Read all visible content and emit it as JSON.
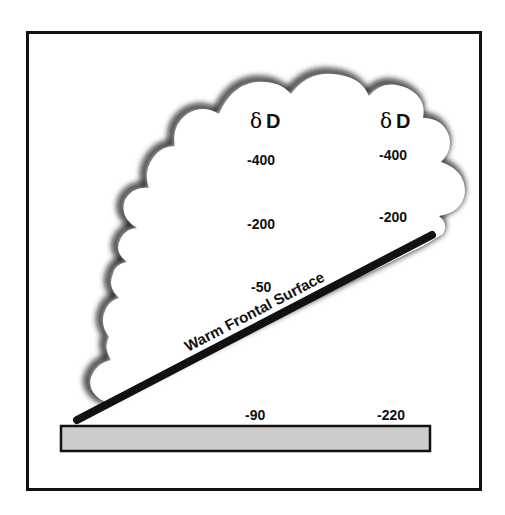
{
  "diagram": {
    "title": "",
    "frontal_surface_label": "Warm Frontal Surface",
    "columns": [
      {
        "header_symbol": "δ",
        "header_letter": "D",
        "values": [
          "-400",
          "-200",
          "-50"
        ],
        "surface_value": "-90"
      },
      {
        "header_symbol": "δ",
        "header_letter": "D",
        "values": [
          "-400",
          "-200"
        ],
        "surface_value": "-220"
      }
    ],
    "colors": {
      "frame": "#111111",
      "front_line": "#111111",
      "ground": "#cccccc",
      "cloud_shadow": "#111111",
      "background": "#ffffff"
    }
  }
}
